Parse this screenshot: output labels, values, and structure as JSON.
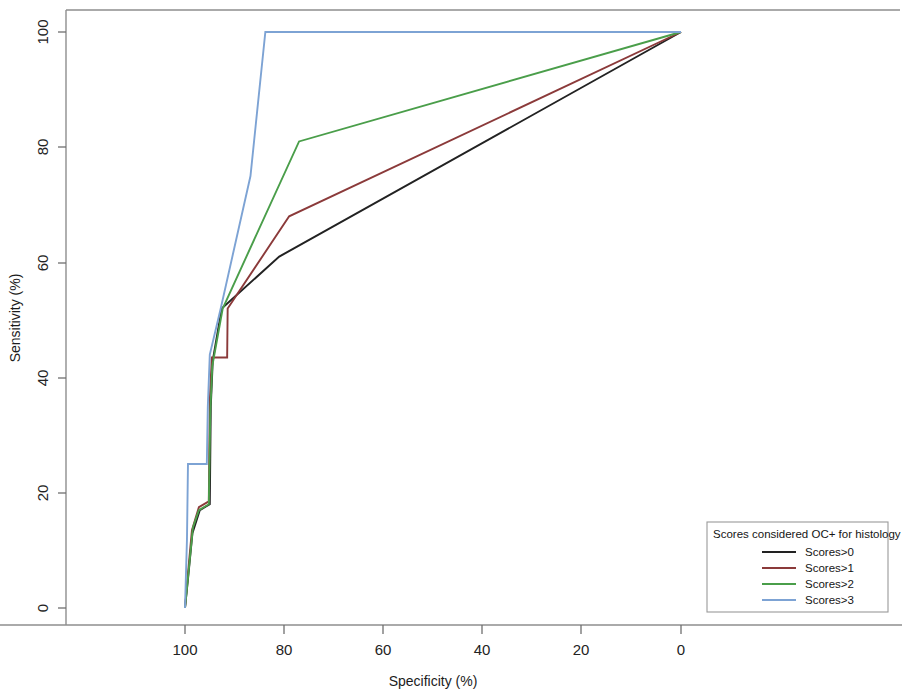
{
  "chart_data": {
    "type": "line",
    "title": "",
    "subtitle": "",
    "xlabel": "Specificity (%)",
    "ylabel": "Sensitivity (%)",
    "xticks": [
      100,
      80,
      60,
      40,
      20,
      0
    ],
    "yticks": [
      0,
      20,
      40,
      60,
      80,
      100
    ],
    "xlim": [
      104,
      -4
    ],
    "ylim": [
      -4,
      104
    ],
    "x_axis_reversed": true,
    "grid": false,
    "legend_position": "bottom-right",
    "legend_title": "Scores considered OC+ for histology",
    "series": [
      {
        "name": "Scores>0",
        "color": "#222222",
        "points": [
          [
            100.0,
            0.0
          ],
          [
            99.4,
            5.0
          ],
          [
            98.5,
            13.0
          ],
          [
            97.0,
            17.0
          ],
          [
            95.0,
            18.0
          ],
          [
            94.8,
            35.0
          ],
          [
            94.4,
            43.0
          ],
          [
            92.6,
            52.0
          ],
          [
            81.0,
            61.0
          ],
          [
            0.0,
            100.0
          ]
        ]
      },
      {
        "name": "Scores>1",
        "color": "#8b3a3a",
        "points": [
          [
            100.0,
            0.0
          ],
          [
            99.4,
            6.0
          ],
          [
            98.6,
            13.5
          ],
          [
            97.2,
            17.5
          ],
          [
            95.2,
            18.5
          ],
          [
            95.0,
            36.0
          ],
          [
            94.6,
            43.5
          ],
          [
            91.5,
            43.5
          ],
          [
            91.4,
            52.0
          ],
          [
            79.0,
            68.0
          ],
          [
            0.0,
            100.0
          ]
        ]
      },
      {
        "name": "Scores>2",
        "color": "#4a9e4a",
        "points": [
          [
            100.0,
            0.0
          ],
          [
            99.2,
            7.0
          ],
          [
            98.4,
            14.0
          ],
          [
            97.2,
            17.0
          ],
          [
            95.2,
            18.0
          ],
          [
            94.9,
            34.0
          ],
          [
            94.5,
            42.0
          ],
          [
            92.4,
            52.0
          ],
          [
            77.0,
            81.0
          ],
          [
            0.0,
            100.0
          ]
        ]
      },
      {
        "name": "Scores>3",
        "color": "#7da3d4",
        "points": [
          [
            100.0,
            0.0
          ],
          [
            99.6,
            12.0
          ],
          [
            99.4,
            25.0
          ],
          [
            95.6,
            25.0
          ],
          [
            95.4,
            35.0
          ],
          [
            95.0,
            44.0
          ],
          [
            92.8,
            52.0
          ],
          [
            86.8,
            75.0
          ],
          [
            83.8,
            100.0
          ],
          [
            0.0,
            100.0
          ]
        ]
      }
    ]
  },
  "axes": {
    "y_title": "Sensitivity (%)",
    "x_title": "Specificity (%)",
    "x_tick_labels": [
      "100",
      "80",
      "60",
      "40",
      "20",
      "0"
    ],
    "y_tick_labels": [
      "0",
      "20",
      "40",
      "60",
      "80",
      "100"
    ]
  },
  "legend": {
    "title": "Scores considered OC+ for histology",
    "entries": [
      {
        "label": "Scores>0",
        "color": "#222222"
      },
      {
        "label": "Scores>1",
        "color": "#8b3a3a"
      },
      {
        "label": "Scores>2",
        "color": "#4a9e4a"
      },
      {
        "label": "Scores>3",
        "color": "#7da3d4"
      }
    ]
  },
  "colors": {
    "frame": "#8e8e8e",
    "background": "#ffffff",
    "text": "#1a1a1a"
  }
}
